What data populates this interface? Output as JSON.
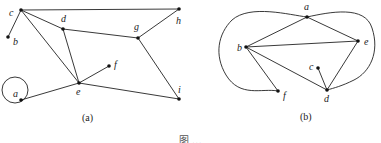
{
  "figure": {
    "caption_partial": "图 …",
    "subfigures": [
      {
        "id": "a",
        "caption": "(a)",
        "nodes": [
          {
            "label": "a",
            "x": 21,
            "y": 100
          },
          {
            "label": "b",
            "x": 8,
            "y": 37
          },
          {
            "label": "c",
            "x": 21,
            "y": 10
          },
          {
            "label": "d",
            "x": 63,
            "y": 29
          },
          {
            "label": "e",
            "x": 79,
            "y": 83
          },
          {
            "label": "f",
            "x": 109,
            "y": 66
          },
          {
            "label": "g",
            "x": 138,
            "y": 38
          },
          {
            "label": "h",
            "x": 179,
            "y": 9
          },
          {
            "label": "i",
            "x": 179,
            "y": 99
          }
        ],
        "edges": [
          [
            "c",
            "b"
          ],
          [
            "c",
            "h"
          ],
          [
            "c",
            "d"
          ],
          [
            "c",
            "e"
          ],
          [
            "d",
            "e"
          ],
          [
            "d",
            "g"
          ],
          [
            "g",
            "h"
          ],
          [
            "g",
            "i"
          ],
          [
            "e",
            "f"
          ],
          [
            "e",
            "i"
          ],
          [
            "a",
            "e"
          ],
          [
            "a",
            "a"
          ]
        ]
      },
      {
        "id": "b",
        "caption": "(b)",
        "nodes": [
          {
            "label": "a",
            "x": 307,
            "y": 17
          },
          {
            "label": "b",
            "x": 246,
            "y": 47
          },
          {
            "label": "c",
            "x": 318,
            "y": 68
          },
          {
            "label": "d",
            "x": 327,
            "y": 90
          },
          {
            "label": "e",
            "x": 358,
            "y": 41
          },
          {
            "label": "f",
            "x": 278,
            "y": 91
          }
        ],
        "edges": [
          [
            "a",
            "b"
          ],
          [
            "a",
            "e"
          ],
          [
            "b",
            "e"
          ],
          [
            "b",
            "d"
          ],
          [
            "b",
            "f"
          ],
          [
            "c",
            "d"
          ],
          [
            "d",
            "e"
          ],
          [
            "f",
            "a",
            "curved-left"
          ],
          [
            "a",
            "d",
            "curved-right"
          ]
        ]
      }
    ]
  }
}
